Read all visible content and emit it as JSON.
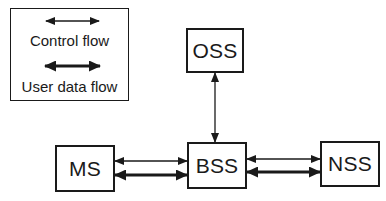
{
  "legend": {
    "items": [
      {
        "label": "Control flow",
        "style": "thin-double-arrow"
      },
      {
        "label": "User data flow",
        "style": "thick-double-arrow"
      }
    ]
  },
  "nodes": {
    "oss": {
      "label": "OSS"
    },
    "bss": {
      "label": "BSS"
    },
    "ms": {
      "label": "MS"
    },
    "nss": {
      "label": "NSS"
    }
  },
  "connections": [
    {
      "from": "OSS",
      "to": "BSS",
      "type": "Control flow"
    },
    {
      "from": "MS",
      "to": "BSS",
      "type": "Control flow"
    },
    {
      "from": "MS",
      "to": "BSS",
      "type": "User data flow"
    },
    {
      "from": "BSS",
      "to": "NSS",
      "type": "Control flow"
    },
    {
      "from": "BSS",
      "to": "NSS",
      "type": "User data flow"
    }
  ],
  "colors": {
    "ink": "#1a1a1a",
    "background": "#ffffff"
  }
}
